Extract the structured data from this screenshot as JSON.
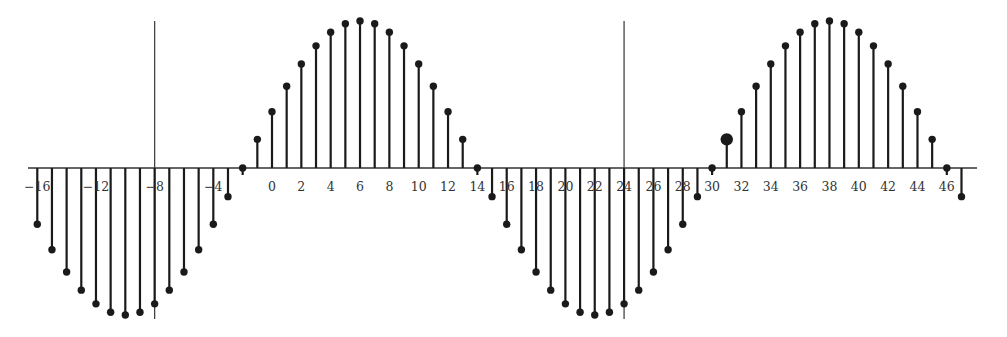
{
  "chart_data": {
    "type": "stem",
    "title": "",
    "xlabel": "",
    "ylabel": "",
    "n": [
      -16,
      -15,
      -14,
      -13,
      -12,
      -11,
      -10,
      -9,
      -8,
      -7,
      -6,
      -5,
      -4,
      -3,
      -2,
      -1,
      0,
      1,
      2,
      3,
      4,
      5,
      6,
      7,
      8,
      9,
      10,
      11,
      12,
      13,
      14,
      15,
      16,
      17,
      18,
      19,
      20,
      21,
      22,
      23,
      24,
      25,
      26,
      27,
      28,
      29,
      30,
      31,
      32,
      33,
      34,
      35,
      36,
      37,
      38,
      39,
      40,
      41,
      42,
      43,
      44,
      45,
      46,
      47
    ],
    "values": [
      -0.383,
      -0.556,
      -0.707,
      -0.831,
      -0.924,
      -0.981,
      -1.0,
      -0.981,
      -0.924,
      -0.831,
      -0.707,
      -0.556,
      -0.383,
      -0.195,
      0.0,
      0.195,
      0.383,
      0.556,
      0.707,
      0.831,
      0.924,
      0.981,
      1.0,
      0.981,
      0.924,
      0.831,
      0.707,
      0.556,
      0.383,
      0.195,
      0.0,
      -0.195,
      -0.383,
      -0.556,
      -0.707,
      -0.831,
      -0.924,
      -0.981,
      -1.0,
      -0.981,
      -0.924,
      -0.831,
      -0.707,
      -0.556,
      -0.383,
      -0.195,
      0.0,
      0.195,
      0.383,
      0.556,
      0.707,
      0.831,
      0.924,
      0.981,
      1.0,
      0.981,
      0.924,
      0.831,
      0.707,
      0.556,
      0.383,
      0.195,
      0.0,
      -0.195
    ],
    "highlighted_n": 31,
    "x_tick_labels": [
      "−16",
      "−12",
      "−8",
      "−4",
      "0",
      "2",
      "4",
      "6",
      "8",
      "10",
      "12",
      "14",
      "16",
      "18",
      "20",
      "22",
      "24",
      "26",
      "28",
      "30",
      "32",
      "34",
      "36",
      "38",
      "40",
      "42",
      "44",
      "46"
    ],
    "x_ticks": [
      -16,
      -12,
      -8,
      -4,
      0,
      2,
      4,
      6,
      8,
      10,
      12,
      14,
      16,
      18,
      20,
      22,
      24,
      26,
      28,
      30,
      32,
      34,
      36,
      38,
      40,
      42,
      44,
      46
    ],
    "vertical_reference_lines": [
      -8,
      24
    ],
    "ylim": [
      -1.0,
      1.0
    ],
    "grid": false,
    "legend": null,
    "colors": {
      "stem": "#1a1a1a",
      "axis": "#333333",
      "reference_line": "#444444"
    }
  },
  "layout": {
    "origin_x": 272,
    "step_px": 14.67,
    "axis_y": 168,
    "amplitude_px": 147,
    "axis_x_start": 28,
    "axis_x_end": 977
  }
}
